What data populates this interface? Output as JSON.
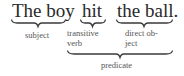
{
  "sentence": {
    "words": [
      {
        "text": "The boy"
      },
      {
        "text": "hit"
      },
      {
        "text": "the ball."
      }
    ]
  },
  "labels": {
    "subject": "subject",
    "verb_line1": "transitive",
    "verb_line2": "verb",
    "object_line1": "direct ob-",
    "object_line2": "ject",
    "predicate": "predicate"
  }
}
